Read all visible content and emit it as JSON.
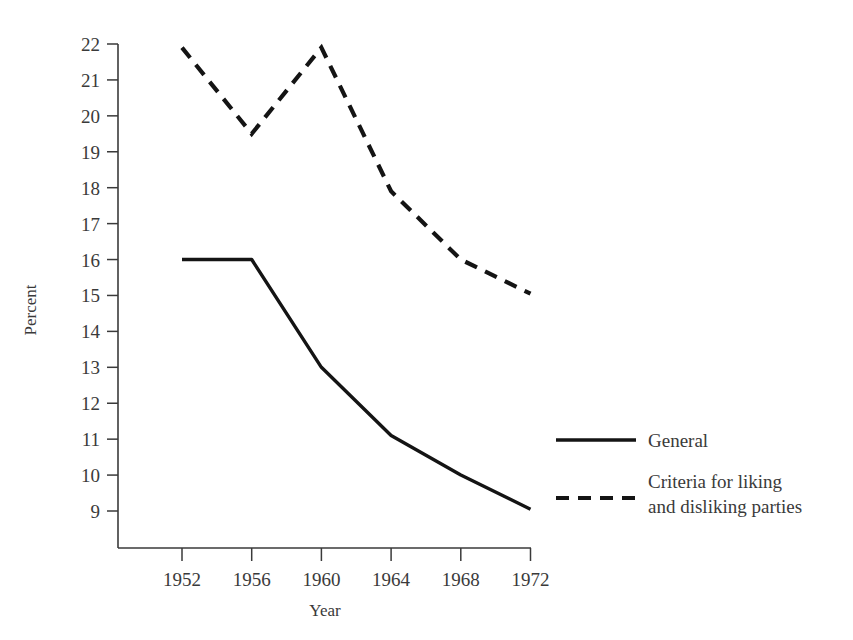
{
  "chart_data": {
    "type": "line",
    "title": "",
    "xlabel": "Year",
    "ylabel": "Percent",
    "x": [
      1952,
      1956,
      1960,
      1964,
      1968,
      1972
    ],
    "categories": [
      "1952",
      "1956",
      "1960",
      "1964",
      "1968",
      "1972"
    ],
    "xlim": [
      1950,
      1974
    ],
    "ylim": [
      8.3,
      22
    ],
    "yticks": [
      9,
      10,
      11,
      12,
      13,
      14,
      15,
      16,
      17,
      18,
      19,
      20,
      21,
      22
    ],
    "ytick_labels": [
      "9",
      "10",
      "11",
      "12",
      "13",
      "14",
      "15",
      "16",
      "17",
      "18",
      "19",
      "20",
      "21",
      "22"
    ],
    "xticks": [
      1952,
      1956,
      1960,
      1964,
      1968,
      1972
    ],
    "xtick_labels": [
      "1952",
      "1956",
      "1960",
      "1964",
      "1968",
      "1972"
    ],
    "grid": false,
    "legend_position": "right-middle",
    "series": [
      {
        "name": "General",
        "style": "solid",
        "color": "#141414",
        "values": [
          16.0,
          16.0,
          13.0,
          11.1,
          10.0,
          9.05
        ]
      },
      {
        "name": "Criteria for liking and disliking parties",
        "style": "dashed",
        "color": "#141414",
        "values": [
          21.9,
          19.5,
          21.9,
          17.9,
          16.0,
          15.05
        ]
      }
    ]
  },
  "axes": {
    "y_axis_label": "Percent",
    "x_axis_label": "Year"
  },
  "legend": {
    "entries": [
      {
        "label": "General",
        "style": "solid",
        "line2": ""
      },
      {
        "label": "Criteria for liking",
        "style": "dashed",
        "line2": "and disliking parties"
      }
    ]
  }
}
